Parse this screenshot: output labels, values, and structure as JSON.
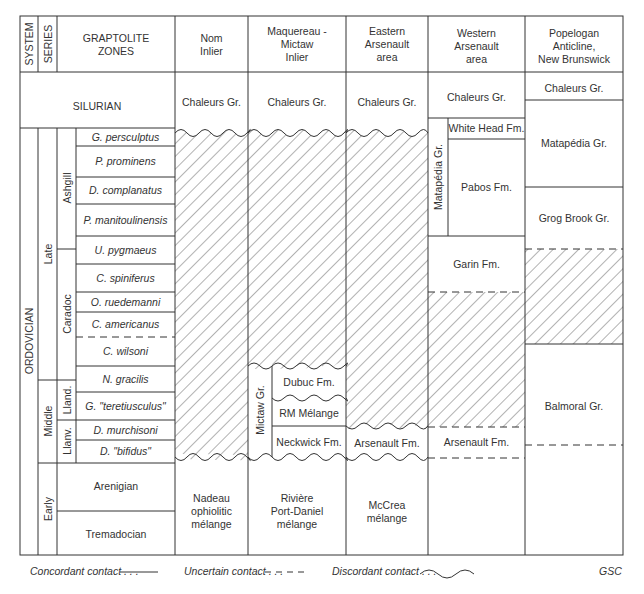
{
  "header": {
    "system": "SYSTEM",
    "series": "SERIES",
    "zones": [
      "GRAPTOLITE",
      "ZONES"
    ],
    "columns": [
      {
        "id": "nom",
        "lines": [
          "Nom",
          "Inlier"
        ]
      },
      {
        "id": "maq",
        "lines": [
          "Maquereau -",
          "Mictaw",
          "Inlier"
        ]
      },
      {
        "id": "east",
        "lines": [
          "Eastern",
          "Arsenault",
          "area"
        ]
      },
      {
        "id": "west",
        "lines": [
          "Western",
          "Arsenault",
          "area"
        ]
      },
      {
        "id": "pope",
        "lines": [
          "Popelogan",
          "Anticline,",
          "New Brunswick"
        ]
      }
    ]
  },
  "silurian": {
    "label": "SILURIAN",
    "nom": "Chaleurs Gr.",
    "maq": "Chaleurs Gr.",
    "east": "Chaleurs Gr.",
    "west": "Chaleurs Gr.",
    "pope": "Chaleurs Gr."
  },
  "system": {
    "ordovician": "ORDOVICIAN"
  },
  "series": {
    "late": "Late",
    "middle": "Middle",
    "early": "Early"
  },
  "stages": {
    "ashgill": "Ashgill",
    "caradoc": "Caradoc",
    "lland": "Lland.",
    "llanv": "Llanv."
  },
  "zones": [
    "G. persculptus",
    "P. prominens",
    "D. complanatus",
    "P. manitoulinensis",
    "U. pygmaeus",
    "C. spiniferus",
    "O. ruedemanni",
    "C. americanus",
    "C. wilsoni",
    "N. gracilis",
    "G. \"teretiusculus\"",
    "D. murchisoni",
    "D. \"bifidus\"",
    "Arenigian",
    "Tremadocian"
  ],
  "units": {
    "nom": {
      "base": [
        "Nadeau",
        "ophiolitic",
        "mélange"
      ]
    },
    "maq": {
      "group": "Mictaw Gr.",
      "dubuc": "Dubuc Fm.",
      "rm": "RM Mélange",
      "neckwick": "Neckwick Fm.",
      "base": [
        "Rivière",
        "Port-Daniel",
        "mélange"
      ]
    },
    "east": {
      "arsenault": "Arsenault Fm.",
      "base": [
        "McCrea",
        "mélange"
      ]
    },
    "west": {
      "group": "Matapédia Gr.",
      "whitehead": "White Head Fm.",
      "pabos": "Pabos Fm.",
      "garin": "Garin Fm.",
      "arsenault": "Arsenault Fm."
    },
    "pope": {
      "matapedia": "Matapédia Gr.",
      "grogbrook": "Grog Brook Gr.",
      "balmoral": "Balmoral Gr."
    }
  },
  "legend": {
    "concordant": "Concordant contact . . .",
    "uncertain": "Uncertain contact . . .",
    "discordant": "Discordant contact . . .",
    "credit": "GSC"
  }
}
